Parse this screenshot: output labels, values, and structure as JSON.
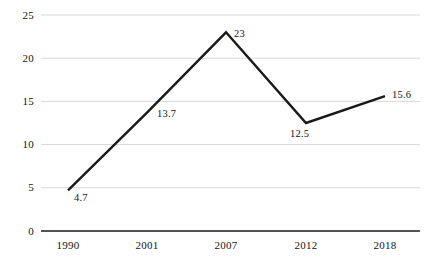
{
  "chart_data": {
    "type": "line",
    "title": "",
    "subtitle": "",
    "xlabel": "",
    "ylabel": "",
    "categories": [
      "1990",
      "2001",
      "2007",
      "2012",
      "2018"
    ],
    "values": [
      4.7,
      13.7,
      23,
      12.5,
      15.6
    ],
    "point_labels": [
      "4.7",
      "13.7",
      "23",
      "12.5",
      "15.6"
    ],
    "series": [
      {
        "name": "",
        "values": [
          4.7,
          13.7,
          23,
          12.5,
          15.6
        ]
      }
    ],
    "ylim": [
      0,
      25
    ],
    "yticks": [
      0,
      5,
      10,
      15,
      20,
      25
    ],
    "ytick_labels": [
      "0",
      "5",
      "10",
      "15",
      "20",
      "25"
    ],
    "grid": true,
    "grid_axis": "y",
    "legend": false,
    "legend_position": "none",
    "line_color": "#1a1a1a",
    "grid_color": "#d9d9d9",
    "axis_color": "#1a1a1a",
    "background_color": "#ffffff",
    "markers": false,
    "line_width": 2.4
  },
  "axis": {
    "y_labels": [
      "25",
      "20",
      "15",
      "10",
      "5",
      "0"
    ],
    "x_labels": [
      "1990",
      "2001",
      "2007",
      "2012",
      "2018"
    ]
  },
  "labels": {
    "p0": "4.7",
    "p1": "13.7",
    "p2": "23",
    "p3": "12.5",
    "p4": "15.6"
  }
}
